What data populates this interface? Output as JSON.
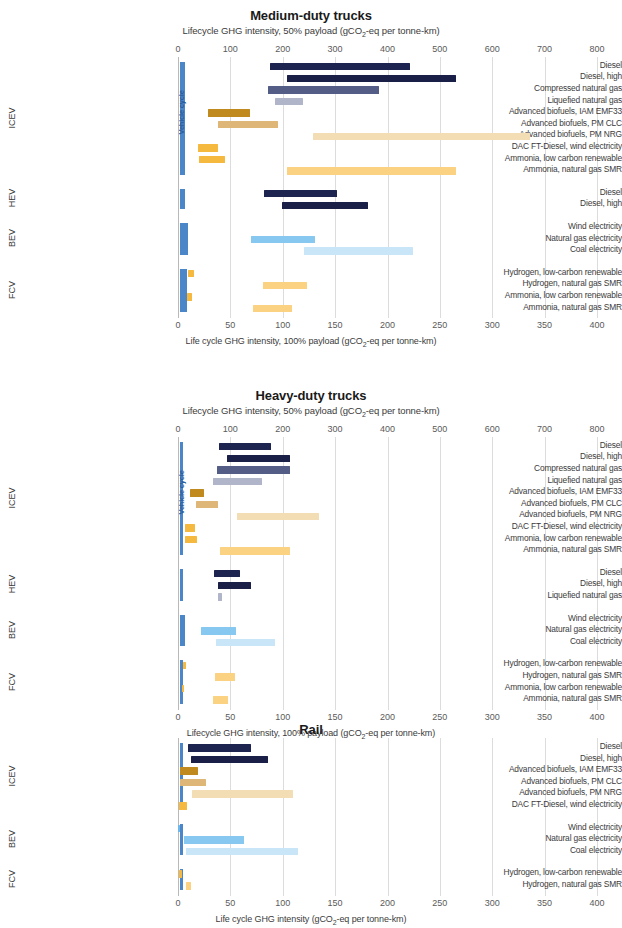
{
  "figure": {
    "width": 622,
    "height": 919,
    "axis_caption_bottom_1": "Life cycle GHG intensity, 100% payload (gCO₂-eq per tonne-km)",
    "axis_caption_bottom_2": "Lifecycle GHG intensity, 100% payload (gCO₂-eq per tonne-km)",
    "axis_caption_bottom_3": "Life cycle GHG intensity (gCO₂-eq per tonne-km)",
    "vehicle_cycle_label": "Vehicle cycle"
  },
  "colors": {
    "diesel": "#1e2450",
    "diesel_high": "#1a1f47",
    "cng": "#545d85",
    "lng": "#b0b5c9",
    "biofuel_emf33": "#c08a1e",
    "biofuel_pmclc": "#ddb678",
    "biofuel_pmnrg": "#f3ddb4",
    "dac_ft": "#f6b93f",
    "ammonia_renewable": "#f6b93f",
    "ammonia_smr": "#fbd182",
    "wind_electricity": "#6cb8ea",
    "natgas_electricity": "#86c8f0",
    "coal_electricity": "#c9e6f9",
    "hydrogen_renewable": "#f6b93f",
    "hydrogen_smr": "#fbd182",
    "vehicle_cycle": "#4a86c8",
    "grid": "#dcdcdc",
    "axis": "#b9b9b9"
  },
  "chart_data": [
    {
      "type": "bar",
      "orientation": "horizontal",
      "style": "floating-range-bars",
      "title": "Medium-duty trucks",
      "subtitle": "Lifecycle GHG intensity, 50% payload (gCO₂-eq per tonne-km)",
      "top_axis": {
        "label": "Lifecycle GHG intensity, 50% payload (gCO₂-eq per tonne-km)",
        "ticks": [
          0,
          100,
          200,
          300,
          400,
          500,
          600,
          700,
          800
        ],
        "xlim": [
          0,
          800
        ]
      },
      "bottom_axis": {
        "label": "Life cycle GHG intensity, 100% payload (gCO₂-eq per tonne-km)",
        "ticks": [
          0,
          50,
          100,
          150,
          200,
          250,
          300,
          350,
          400
        ],
        "xlim": [
          0,
          400
        ]
      },
      "grid": true,
      "legend_position": "none",
      "groups": [
        {
          "name": "ICEV",
          "vehicle_cycle": {
            "low": 0,
            "high": 10
          },
          "rows": [
            {
              "label": "Diesel",
              "low": 175,
              "high": 443,
              "color_key": "diesel"
            },
            {
              "label": "Diesel, high",
              "low": 208,
              "high": 530,
              "color_key": "diesel_high"
            },
            {
              "label": "Compressed natural gas",
              "low": 172,
              "high": 383,
              "color_key": "cng"
            },
            {
              "label": "Liquefied natural gas",
              "low": 186,
              "high": 238,
              "color_key": "lng"
            },
            {
              "label": "Advanced biofuels, IAM EMF33",
              "low": 57,
              "high": 138,
              "color_key": "biofuel_emf33"
            },
            {
              "label": "Advanced biofuels, PM CLC",
              "low": 76,
              "high": 190,
              "color_key": "biofuel_pmclc"
            },
            {
              "label": "Advanced biofuels, PM NRG",
              "low": 258,
              "high": 672,
              "color_key": "biofuel_pmnrg"
            },
            {
              "label": "DAC FT-Diesel, wind electricity",
              "low": 38,
              "high": 76,
              "color_key": "dac_ft"
            },
            {
              "label": "Ammonia, low carbon renewable",
              "low": 40,
              "high": 90,
              "color_key": "ammonia_renewable"
            },
            {
              "label": "Ammonia, natural gas SMR",
              "low": 208,
              "high": 530,
              "color_key": "ammonia_smr"
            }
          ]
        },
        {
          "name": "HEV",
          "vehicle_cycle": {
            "low": 0,
            "high": 9
          },
          "rows": [
            {
              "label": "Diesel",
              "low": 165,
              "high": 303,
              "color_key": "diesel"
            },
            {
              "label": "Diesel, high",
              "low": 198,
              "high": 362,
              "color_key": "diesel_high"
            }
          ]
        },
        {
          "name": "BEV",
          "vehicle_cycle": {
            "low": 0,
            "high": 16
          },
          "rows": [
            {
              "label": "Wind electricity",
              "low": 0,
              "high": 0,
              "color_key": "wind_electricity"
            },
            {
              "label": "Natural gas electricity",
              "low": 140,
              "high": 262,
              "color_key": "natgas_electricity"
            },
            {
              "label": "Coal electricity",
              "low": 240,
              "high": 449,
              "color_key": "coal_electricity"
            }
          ]
        },
        {
          "name": "FCV",
          "vehicle_cycle": {
            "low": 0,
            "high": 13
          },
          "rows": [
            {
              "label": "Hydrogen, low-carbon renewable",
              "low": 20,
              "high": 30,
              "color_key": "hydrogen_renewable"
            },
            {
              "label": "Hydrogen, natural gas SMR",
              "low": 162,
              "high": 247,
              "color_key": "hydrogen_smr"
            },
            {
              "label": "Ammonia, low carbon renewable",
              "low": 17,
              "high": 27,
              "color_key": "ammonia_renewable"
            },
            {
              "label": "Ammonia, natural gas SMR",
              "low": 144,
              "high": 218,
              "color_key": "ammonia_smr"
            }
          ]
        }
      ]
    },
    {
      "type": "bar",
      "orientation": "horizontal",
      "style": "floating-range-bars",
      "title": "Heavy-duty trucks",
      "subtitle": "Lifecycle GHG intensity, 50% payload (gCO₂-eq per tonne-km)",
      "top_axis": {
        "label": "Lifecycle GHG intensity, 50% payload (gCO₂-eq per tonne-km)",
        "ticks": [
          0,
          100,
          200,
          300,
          400,
          500,
          600,
          700,
          800
        ],
        "xlim": [
          0,
          800
        ]
      },
      "bottom_axis": {
        "label": "Lifecycle GHG intensity, 100% payload (gCO₂-eq per tonne-km)",
        "ticks": [
          0,
          50,
          100,
          150,
          200,
          250,
          300,
          350,
          400
        ],
        "xlim": [
          0,
          400
        ]
      },
      "grid": true,
      "legend_position": "none",
      "groups": [
        {
          "name": "ICEV",
          "vehicle_cycle": {
            "low": 0,
            "high": 5
          },
          "rows": [
            {
              "label": "Diesel",
              "low": 78,
              "high": 178,
              "color_key": "diesel"
            },
            {
              "label": "Diesel, high",
              "low": 94,
              "high": 213,
              "color_key": "diesel_high"
            },
            {
              "label": "Compressed natural gas",
              "low": 74,
              "high": 213,
              "color_key": "cng"
            },
            {
              "label": "Liquefied natural gas",
              "low": 66,
              "high": 160,
              "color_key": "lng"
            },
            {
              "label": "Advanced biofuels, IAM EMF33",
              "low": 22,
              "high": 50,
              "color_key": "biofuel_emf33"
            },
            {
              "label": "Advanced biofuels, PM CLC",
              "low": 34,
              "high": 76,
              "color_key": "biofuel_pmclc"
            },
            {
              "label": "Advanced biofuels, PM NRG",
              "low": 112,
              "high": 270,
              "color_key": "biofuel_pmnrg"
            },
            {
              "label": "DAC FT-Diesel, wind electricity",
              "low": 14,
              "high": 32,
              "color_key": "dac_ft"
            },
            {
              "label": "Ammonia, low carbon renewable",
              "low": 14,
              "high": 36,
              "color_key": "ammonia_renewable"
            },
            {
              "label": "Ammonia, natural gas SMR",
              "low": 80,
              "high": 213,
              "color_key": "ammonia_smr"
            }
          ]
        },
        {
          "name": "HEV",
          "vehicle_cycle": {
            "low": 0,
            "high": 5
          },
          "rows": [
            {
              "label": "Diesel",
              "low": 68,
              "high": 118,
              "color_key": "diesel"
            },
            {
              "label": "Diesel, high",
              "low": 77,
              "high": 140,
              "color_key": "diesel_high"
            },
            {
              "label": "Liquefied natural gas",
              "low": 76,
              "high": 84,
              "color_key": "lng"
            }
          ]
        },
        {
          "name": "BEV",
          "vehicle_cycle": {
            "low": 0,
            "high": 9
          },
          "rows": [
            {
              "label": "Wind electricity",
              "low": 0,
              "high": 0,
              "color_key": "wind_electricity"
            },
            {
              "label": "Natural gas electricity",
              "low": 44,
              "high": 110,
              "color_key": "natgas_electricity"
            },
            {
              "label": "Coal electricity",
              "low": 72,
              "high": 186,
              "color_key": "coal_electricity"
            }
          ]
        },
        {
          "name": "FCV",
          "vehicle_cycle": {
            "low": 0,
            "high": 4
          },
          "rows": [
            {
              "label": "Hydrogen, low-carbon renewable",
              "low": 9,
              "high": 15,
              "color_key": "hydrogen_renewable"
            },
            {
              "label": "Hydrogen, natural gas SMR",
              "low": 70,
              "high": 108,
              "color_key": "hydrogen_smr"
            },
            {
              "label": "Ammonia, low carbon renewable",
              "low": 7,
              "high": 12,
              "color_key": "ammonia_renewable"
            },
            {
              "label": "Ammonia, natural gas SMR",
              "low": 66,
              "high": 96,
              "color_key": "ammonia_smr"
            }
          ]
        }
      ]
    },
    {
      "type": "bar",
      "orientation": "horizontal",
      "style": "floating-range-bars",
      "title": "Rail",
      "subtitle": "",
      "top_axis": null,
      "bottom_axis": {
        "label": "Life cycle GHG intensity (gCO₂-eq per tonne-km)",
        "ticks": [
          0,
          50,
          100,
          150,
          200,
          250,
          300,
          350,
          400
        ],
        "xlim": [
          0,
          400
        ]
      },
      "grid": true,
      "legend_position": "none",
      "groups": [
        {
          "name": "ICEV",
          "vehicle_cycle": {
            "low": 0,
            "high": 2
          },
          "rows": [
            {
              "label": "Diesel",
              "low": 10,
              "high": 70,
              "color_key": "diesel"
            },
            {
              "label": "Diesel, high",
              "low": 12,
              "high": 86,
              "color_key": "diesel_high"
            },
            {
              "label": "Advanced biofuels, IAM EMF33",
              "low": 2,
              "high": 19,
              "color_key": "biofuel_emf33"
            },
            {
              "label": "Advanced biofuels, PM CLC",
              "low": 2,
              "high": 27,
              "color_key": "biofuel_pmclc"
            },
            {
              "label": "Advanced biofuels, PM NRG",
              "low": 13,
              "high": 110,
              "color_key": "biofuel_pmnrg"
            },
            {
              "label": "DAC FT-Diesel, wind electricity",
              "low": 1,
              "high": 9,
              "color_key": "dac_ft"
            }
          ]
        },
        {
          "name": "BEV",
          "vehicle_cycle": {
            "low": 0,
            "high": 1
          },
          "rows": [
            {
              "label": "Wind electricity",
              "low": 0,
              "high": 2,
              "color_key": "wind_electricity"
            },
            {
              "label": "Natural gas electricity",
              "low": 6,
              "high": 63,
              "color_key": "natgas_electricity"
            },
            {
              "label": "Coal electricity",
              "low": 8,
              "high": 115,
              "color_key": "coal_electricity"
            }
          ]
        },
        {
          "name": "FCV",
          "vehicle_cycle": {
            "low": 0,
            "high": 1
          },
          "rows": [
            {
              "label": "Hydrogen, low-carbon renewable",
              "low": 1,
              "high": 4,
              "color_key": "hydrogen_renewable"
            },
            {
              "label": "Hydrogen, natural gas SMR",
              "low": 8,
              "high": 12,
              "color_key": "hydrogen_smr"
            }
          ]
        }
      ]
    }
  ]
}
